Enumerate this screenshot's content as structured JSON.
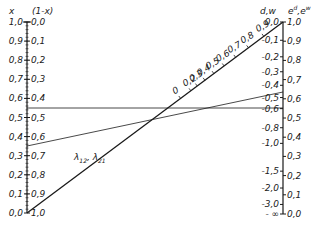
{
  "left_axis": {
    "header_x": "x",
    "header_1mx": "(1-x)",
    "ticks": [
      {
        "x": "1,0",
        "omx": "0,0"
      },
      {
        "x": "0,9",
        "omx": "0,1"
      },
      {
        "x": "0,8",
        "omx": "0,2"
      },
      {
        "x": "0,7",
        "omx": "0,3"
      },
      {
        "x": "0,6",
        "omx": "0,4"
      },
      {
        "x": "0,5",
        "omx": "0,5"
      },
      {
        "x": "0,4",
        "omx": "0,6"
      },
      {
        "x": "0,3",
        "omx": "0,7"
      },
      {
        "x": "0,2",
        "omx": "0,8"
      },
      {
        "x": "0,1",
        "omx": "0,9"
      },
      {
        "x": "0,0",
        "omx": "1,0"
      }
    ]
  },
  "right_axis": {
    "header_dw": "d,w",
    "header_e": "e",
    "header_sup_d": "d",
    "header_sep": ",e",
    "header_sup_w": "w",
    "left_ticks": [
      "0,0",
      "-0,1",
      "-0,2",
      "-0,3",
      "-0,4",
      "-0,5",
      "-0,6",
      "-0,8",
      "-1,0",
      "-1,5",
      "-2,0",
      "-3,0",
      "- ∞"
    ],
    "right_ticks": [
      "1,0",
      "0,9",
      "0,8",
      "0,7",
      "0,6",
      "0,5",
      "0,4",
      "0,3",
      "0,2",
      "0,1",
      "0,0"
    ]
  },
  "diagonal": {
    "label": "λ12, λ21",
    "label_main": "λ",
    "sub1": "12",
    "sep": ", λ",
    "sub2": "21",
    "ticks": [
      "0",
      "0,2",
      "0,3",
      "0,4",
      "0,5",
      "0,6",
      "0,7",
      "0,8",
      "0,9"
    ]
  },
  "colors": {
    "ink": "#1a1a1a",
    "background": "#ffffff"
  }
}
